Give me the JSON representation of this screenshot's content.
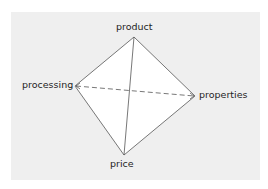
{
  "diagram": {
    "type": "tetrahedron",
    "colors": {
      "panel_background": "#efefef",
      "face_fill": "#ffffff",
      "edge_stroke": "#555555",
      "label_text": "#1e1e1e"
    },
    "nodes": [
      {
        "id": "product",
        "label": "product",
        "x": 134,
        "y": 37
      },
      {
        "id": "processing",
        "label": "processing",
        "x": 75,
        "y": 86
      },
      {
        "id": "properties",
        "label": "properties",
        "x": 195,
        "y": 96
      },
      {
        "id": "price",
        "label": "price",
        "x": 124,
        "y": 155
      }
    ],
    "edges": [
      {
        "from": "product",
        "to": "processing",
        "style": "solid"
      },
      {
        "from": "product",
        "to": "properties",
        "style": "solid"
      },
      {
        "from": "product",
        "to": "price",
        "style": "solid"
      },
      {
        "from": "processing",
        "to": "price",
        "style": "solid"
      },
      {
        "from": "properties",
        "to": "price",
        "style": "solid"
      },
      {
        "from": "processing",
        "to": "properties",
        "style": "dashed",
        "arrowheads": "both"
      }
    ]
  }
}
